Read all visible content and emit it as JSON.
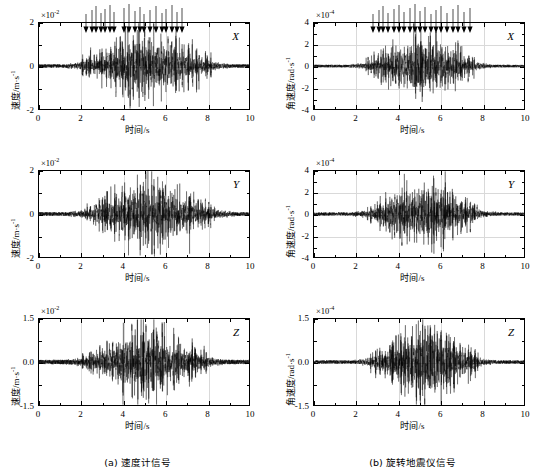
{
  "figure": {
    "width": 550,
    "height": 472,
    "background": "#ffffff",
    "line_color": "#000000",
    "grid_color": "#d9d9d9"
  },
  "columns": [
    {
      "id": "a",
      "caption": "(a) 速度计信号",
      "xlabel_cn": "时间",
      "xlabel_unit": "/s",
      "ylabel_cn": "速度",
      "ylabel_unit": "/m·s",
      "ylabel_exp": "-1",
      "exponent": "×10",
      "exponent_sup": "-2",
      "panels": [
        {
          "component": "X",
          "yticks": [
            "2",
            "0",
            "-2"
          ],
          "ylim": [
            -2,
            2
          ],
          "has_arrows": true
        },
        {
          "component": "Y",
          "yticks": [
            "2",
            "0",
            "-2"
          ],
          "ylim": [
            -2,
            2
          ],
          "has_arrows": false
        },
        {
          "component": "Z",
          "yticks": [
            "1.5",
            "0.0",
            "-1.5"
          ],
          "ylim": [
            -1.5,
            1.5
          ],
          "has_arrows": false
        }
      ]
    },
    {
      "id": "b",
      "caption": "(b) 旋转地震仪信号",
      "xlabel_cn": "时间",
      "xlabel_unit": "/s",
      "ylabel_cn": "角速度",
      "ylabel_unit": "/rad·s",
      "ylabel_exp": "-1",
      "exponent": "×10",
      "exponent_sup": "-4",
      "panels": [
        {
          "component": "X",
          "yticks": [
            "4",
            "2",
            "0",
            "-2",
            "-4"
          ],
          "ylim": [
            -4,
            4
          ],
          "has_arrows": true
        },
        {
          "component": "Y",
          "yticks": [
            "4",
            "2",
            "0",
            "-2",
            "-4"
          ],
          "ylim": [
            -4,
            4
          ],
          "has_arrows": false
        },
        {
          "component": "Z",
          "yticks": [
            "1.5",
            "0.0",
            "-1.5"
          ],
          "ylim": [
            -1.5,
            1.5
          ],
          "has_arrows": false
        }
      ]
    }
  ],
  "xticks": [
    "0",
    "2",
    "4",
    "6",
    "8",
    "10"
  ],
  "xlim": [
    0,
    10
  ],
  "chart_data": {
    "type": "line",
    "title": "",
    "subplot_grid": [
      3,
      2
    ],
    "xlabel": "时间/s",
    "xlim": [
      0,
      10
    ],
    "xticks": [
      0,
      2,
      4,
      6,
      8,
      10
    ],
    "grid": true,
    "legend": "none",
    "series": [
      {
        "name": "速度计信号 X",
        "panel": "a-X",
        "ylabel": "速度/m·s⁻¹",
        "y_scale": 0.01,
        "ylim": [
          -2,
          2
        ],
        "yticks": [
          -2,
          0,
          2
        ],
        "signal": "seismic burst",
        "onset_s": 1.8,
        "coda_end_s": 8.6,
        "peak_envelope": 1.9,
        "background_noise": 0.08,
        "arrow_times": [
          2.25,
          2.55,
          2.75,
          2.95,
          3.15,
          3.4,
          3.6,
          4.05,
          4.3,
          4.55,
          4.8,
          5.0,
          5.3,
          5.55,
          5.85,
          6.05,
          6.3,
          6.55,
          6.8
        ],
        "arrow_y": 2.0
      },
      {
        "name": "速度计信号 Y",
        "panel": "a-Y",
        "ylabel": "速度/m·s⁻¹",
        "y_scale": 0.01,
        "ylim": [
          -2,
          2
        ],
        "yticks": [
          -2,
          0,
          2
        ],
        "signal": "seismic burst",
        "onset_s": 1.9,
        "coda_end_s": 8.8,
        "peak_envelope": 1.9,
        "background_noise": 0.09,
        "arrow_times": []
      },
      {
        "name": "速度计信号 Z",
        "panel": "a-Z",
        "ylabel": "速度/m·s⁻¹",
        "y_scale": 0.01,
        "ylim": [
          -1.5,
          1.5
        ],
        "yticks": [
          -1.5,
          0.0,
          1.5
        ],
        "signal": "seismic burst",
        "onset_s": 1.8,
        "coda_end_s": 8.4,
        "peak_envelope": 1.42,
        "background_noise": 0.08,
        "arrow_times": []
      },
      {
        "name": "旋转地震仪信号 X",
        "panel": "b-X",
        "ylabel": "角速度/rad·s⁻¹",
        "y_scale": 0.0001,
        "ylim": [
          -4,
          4
        ],
        "yticks": [
          -4,
          -2,
          0,
          2,
          4
        ],
        "signal": "seismic burst",
        "onset_s": 2.2,
        "coda_end_s": 8.2,
        "peak_envelope": 3.4,
        "background_noise": 0.12,
        "arrow_times": [
          2.85,
          3.1,
          3.3,
          3.55,
          3.8,
          4.05,
          4.3,
          4.55,
          4.8,
          5.05,
          5.3,
          5.55,
          5.8,
          6.05,
          6.3,
          6.6,
          6.85,
          7.1,
          7.4
        ],
        "arrow_y": 4.0
      },
      {
        "name": "旋转地震仪信号 Y",
        "panel": "b-Y",
        "ylabel": "角速度/rad·s⁻¹",
        "y_scale": 0.0001,
        "ylim": [
          -4,
          4
        ],
        "yticks": [
          -4,
          -2,
          0,
          2,
          4
        ],
        "signal": "seismic burst",
        "onset_s": 2.3,
        "coda_end_s": 8.2,
        "peak_envelope": 3.5,
        "background_noise": 0.15,
        "arrow_times": []
      },
      {
        "name": "旋转地震仪信号 Z",
        "panel": "b-Z",
        "ylabel": "角速度/rad·s⁻¹",
        "y_scale": 0.0001,
        "ylim": [
          -1.5,
          1.5
        ],
        "yticks": [
          -1.5,
          0.0,
          1.5
        ],
        "signal": "seismic burst",
        "onset_s": 2.4,
        "coda_end_s": 8.2,
        "peak_envelope": 1.4,
        "background_noise": 0.06,
        "arrow_times": []
      }
    ]
  }
}
